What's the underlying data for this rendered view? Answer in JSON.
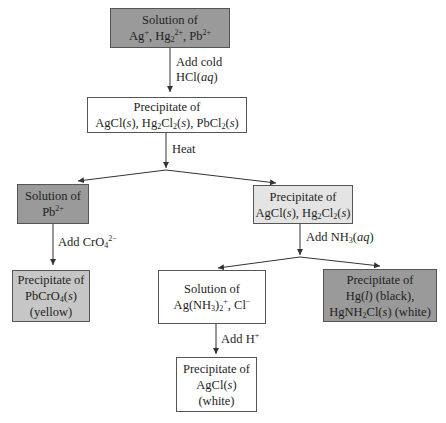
{
  "diagram": {
    "nodes": {
      "start": {
        "line1": "Solution of",
        "line2_parts": [
          "Ag",
          "+",
          ", Hg",
          "2",
          "2+",
          ", Pb",
          "2+"
        ]
      },
      "ppt1": {
        "line1": "Precipitate of",
        "line2": "AgCl(s), Hg2Cl2(s), PbCl2(s)"
      },
      "pb_solution": {
        "line1": "Solution of",
        "line2": "Pb2+"
      },
      "ppt2": {
        "line1": "Precipitate of",
        "line2": "AgCl(s), Hg2Cl2(s)"
      },
      "pbcro4": {
        "line1": "Precipitate of",
        "line2": "PbCrO4(s)",
        "line3": "(yellow)"
      },
      "ag_solution": {
        "line1": "Solution of",
        "line2": "Ag(NH3)2+, Cl−"
      },
      "hg_ppt": {
        "line1": "Precipitate of",
        "line2": "Hg(l) (black),",
        "line3": "HgNH2Cl(s) (white)"
      },
      "agcl": {
        "line1": "Precipitate of",
        "line2": "AgCl(s)",
        "line3": "(white)"
      }
    },
    "edges": {
      "add_cold_hcl_1": "Add cold",
      "add_cold_hcl_2": "HCl(aq)",
      "heat": "Heat",
      "add_cro4": "Add CrO4 2−",
      "add_nh3": "Add NH3(aq)",
      "add_h": "Add H+"
    },
    "colors": {
      "dark_box": "#9a9a9a",
      "mid_box": "#c6c6c6",
      "light_box": "#e4e4e4",
      "white_box": "#ffffff",
      "line": "#333333"
    }
  }
}
